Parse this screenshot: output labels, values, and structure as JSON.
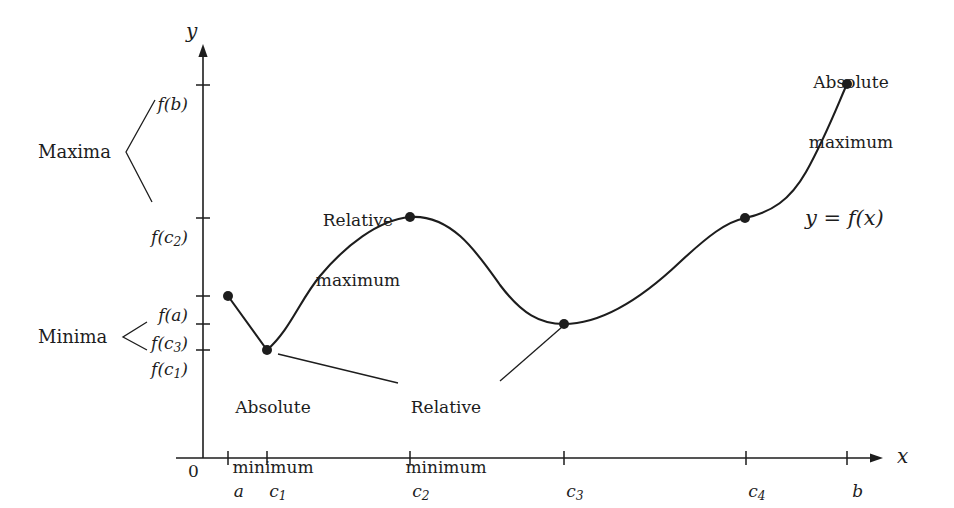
{
  "figure": {
    "ink_color": "#1d1d1d",
    "background_color": "#ffffff"
  },
  "axes": {
    "x_axis_label": "x",
    "y_axis_label": "y",
    "origin_label": "0",
    "x_axis_y_px": 458,
    "y_axis_x_px": 203
  },
  "y_ticks": [
    {
      "id": "fb",
      "label_main": "f(b)",
      "label_plain": "f(b)",
      "y_px": 85
    },
    {
      "id": "fc2",
      "label_main": "f(c",
      "label_sub": "2",
      "label_tail": ")",
      "label_plain": "f(c2)",
      "y_px": 218
    },
    {
      "id": "fa",
      "label_main": "f(a)",
      "label_plain": "f(a)",
      "y_px": 296
    },
    {
      "id": "fc3",
      "label_main": "f(c",
      "label_sub": "3",
      "label_tail": ")",
      "label_plain": "f(c3)",
      "y_px": 324
    },
    {
      "id": "fc1",
      "label_main": "f(c",
      "label_sub": "1",
      "label_tail": ")",
      "label_plain": "f(c1)",
      "y_px": 350
    }
  ],
  "x_ticks": [
    {
      "id": "a",
      "label_main": "a",
      "label_plain": "a",
      "x_px": 228
    },
    {
      "id": "c1",
      "label_main": "c",
      "label_sub": "1",
      "label_plain": "c1",
      "x_px": 267
    },
    {
      "id": "c2",
      "label_main": "c",
      "label_sub": "2",
      "label_plain": "c2",
      "x_px": 410
    },
    {
      "id": "c3",
      "label_main": "c",
      "label_sub": "3",
      "label_plain": "c3",
      "x_px": 564
    },
    {
      "id": "c4",
      "label_main": "c",
      "label_sub": "4",
      "label_plain": "c4",
      "x_px": 746
    },
    {
      "id": "b",
      "label_main": "b",
      "label_plain": "b",
      "x_px": 847
    }
  ],
  "group_labels": {
    "maxima": "Maxima",
    "minima": "Minima"
  },
  "annotations": {
    "relative_maximum": "Relative\nmaximum",
    "relative_maximum_line1": "Relative",
    "relative_maximum_line2": "maximum",
    "absolute_maximum_line1": "Absolute",
    "absolute_maximum_line2": "maximum",
    "absolute_minimum_line1": "Absolute",
    "absolute_minimum_line2": "minimum",
    "relative_minimum_line1": "Relative",
    "relative_minimum_line2": "minimum",
    "curve_equation": "y = f(x)",
    "curve_equation_lhs": "y",
    "curve_equation_eq": "=",
    "curve_equation_rhs": "f(x)"
  },
  "chart_data": {
    "type": "line",
    "xlabel": "x",
    "ylabel": "y",
    "grid": false,
    "legend": "none",
    "xlim_px": [
      203,
      880
    ],
    "ylim_px": [
      458,
      48
    ],
    "x_tick_labels": [
      "a",
      "c1",
      "c2",
      "c3",
      "c4",
      "b"
    ],
    "y_tick_labels": [
      "f(b)",
      "f(c2)",
      "f(a)",
      "f(c3)",
      "f(c1)"
    ],
    "marked_points": [
      {
        "x_label": "a",
        "y_label": "f(a)",
        "x_px": 228,
        "y_px": 296,
        "kind": "endpoint"
      },
      {
        "x_label": "c1",
        "y_label": "f(c1)",
        "x_px": 267,
        "y_px": 350,
        "kind": "absolute minimum"
      },
      {
        "x_label": "c2",
        "y_label": "f(c2)",
        "x_px": 410,
        "y_px": 217,
        "kind": "relative maximum"
      },
      {
        "x_label": "c3",
        "y_label": "f(c3)",
        "x_px": 564,
        "y_px": 324,
        "kind": "relative minimum"
      },
      {
        "x_label": "c4",
        "y_label": "f(c2)",
        "x_px": 745,
        "y_px": 218,
        "kind": "stationary inflection"
      },
      {
        "x_label": "b",
        "y_label": "f(b)",
        "x_px": 847,
        "y_px": 84,
        "kind": "absolute maximum"
      }
    ],
    "series": [
      {
        "name": "y = f(x)",
        "path_px": "M 228 296 L 267 350 C 290 330 300 300 320 276 C 345 246 378 220 410 217 C 452 214 478 254 500 285 C 522 314 540 324 564 324 C 600 324 640 300 680 262 C 708 236 726 222 745 218 C 772 212 790 200 806 172 C 826 136 838 104 847 84"
      }
    ]
  },
  "leader_lines": [
    {
      "name": "maxima-bracket",
      "points": "155,100 126,152 152,202"
    },
    {
      "name": "minima-bracket",
      "points": "147,322 123,337 147,350"
    },
    {
      "name": "absolute-minimum",
      "points": "278,354 398,383"
    },
    {
      "name": "relative-minimum",
      "points": "500,381 562,327"
    }
  ]
}
